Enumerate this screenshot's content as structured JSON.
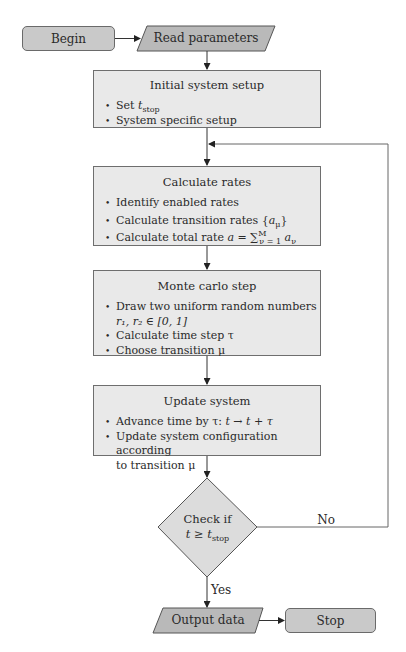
{
  "flowchart": {
    "begin": {
      "label": "Begin"
    },
    "read_parameters": {
      "label": "Read parameters"
    },
    "initial_setup": {
      "title": "Initial system setup",
      "items": [
        {
          "prefix": "Set ",
          "var": "t",
          "sub": "stop"
        },
        {
          "text": "System specific setup"
        }
      ]
    },
    "calculate_rates": {
      "title": "Calculate rates",
      "items": [
        {
          "text": "Identify enabled rates"
        },
        {
          "text": "Calculate transition rates {",
          "var": "a",
          "sub": "μ",
          "suffix": "}"
        },
        {
          "text": "Calculate total rate ",
          "formula": "a = ∑",
          "sup": "M",
          "sub": "ν = 1",
          "tail": " a",
          "tail_sub": "ν"
        }
      ]
    },
    "monte_carlo": {
      "title": "Monte carlo step",
      "items": [
        {
          "text": "Draw two uniform random numbers",
          "cont": "r₁, r₂ ∈ [0, 1]"
        },
        {
          "text": "Calculate time step τ"
        },
        {
          "text": "Choose transition μ"
        }
      ]
    },
    "update_system": {
      "title": "Update system",
      "items": [
        {
          "text": "Advance time by τ: ",
          "formula": "t → t + τ"
        },
        {
          "text": "Update system configuration according",
          "cont": "to transition μ"
        }
      ]
    },
    "decision": {
      "line1": "Check if",
      "line2_prefix": "t ≥ t",
      "line2_sub": "stop"
    },
    "edge_no": "No",
    "edge_yes": "Yes",
    "output_data": {
      "label": "Output data"
    },
    "stop": {
      "label": "Stop"
    }
  },
  "colors": {
    "terminal_fill": "#c9c9c9",
    "io_fill": "#b9b9b9",
    "process_fill": "#e9e9e9",
    "decision_fill": "#dcdcdc",
    "stroke": "#555555"
  }
}
